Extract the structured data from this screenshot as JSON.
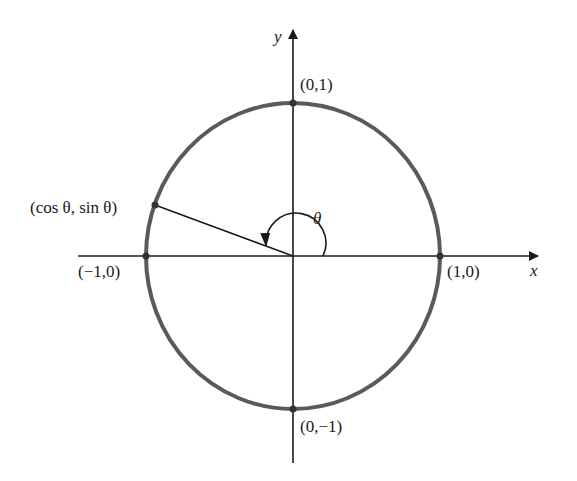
{
  "axes": {
    "x_label": "x",
    "y_label": "y"
  },
  "points": {
    "top": "(0,1)",
    "bottom": "(0,−1)",
    "left": "(−1,0)",
    "right": "(1,0)",
    "terminal": "(cos θ, sin θ)"
  },
  "angle_label": "θ",
  "colors": {
    "circle": "#5a5a5a",
    "axes": "#1a1a1a",
    "text": "#1a1a1a"
  }
}
